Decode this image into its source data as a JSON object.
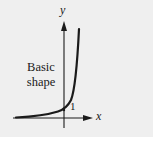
{
  "diagram": {
    "caption_line1": "Basic",
    "caption_line2": "shape",
    "axis_x_label": "x",
    "axis_y_label": "y",
    "intercept_label": "1",
    "curve": "exponential growth y = a^x (a > 1)",
    "colors": {
      "panel_background": "#efefef",
      "page_background": "#ffffff",
      "ink": "#1a1a1a"
    }
  }
}
